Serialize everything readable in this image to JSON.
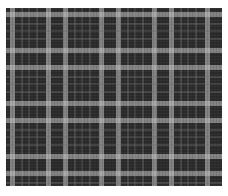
{
  "image": {
    "subject": "plaid fabric texture",
    "description": "Grayscale tartan/plaid cloth swatch on white background",
    "colors": {
      "background": "#ffffff",
      "fabric_base": "#2b2b2b",
      "bright_stripe": "#c8c8c8",
      "mid_stripe": "#787878"
    },
    "pattern": {
      "repeat_px": 53,
      "bright_stripe_width_px": 5,
      "thin_stripe_width_px": 2
    }
  }
}
